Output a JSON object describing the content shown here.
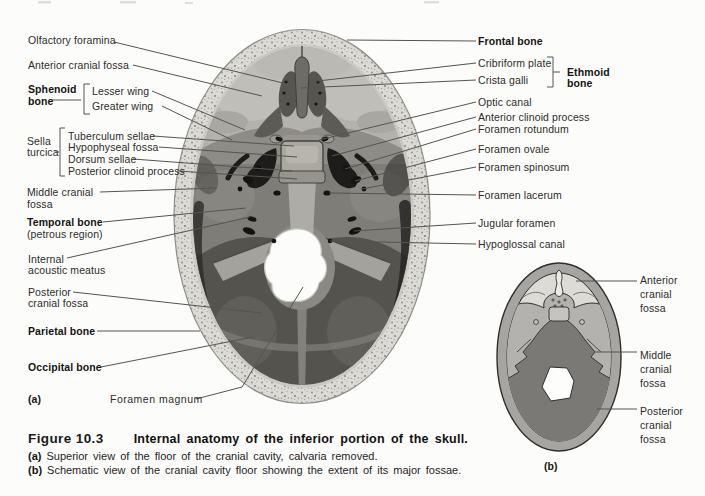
{
  "panel_a": {
    "marker": "(a)",
    "labels": {
      "olfactory_foramina": "Olfactory foramina",
      "anterior_cranial_fossa": "Anterior cranial fossa",
      "sphenoid_bone": [
        "Sphenoid",
        "bone"
      ],
      "lesser_wing": "Lesser wing",
      "greater_wing": "Greater wing",
      "sella_turcica": [
        "Sella",
        "turcica"
      ],
      "tuberculum_sellae": "Tuberculum sellae",
      "hypophyseal_fossa": "Hypophyseal fossa",
      "dorsum_sellae": "Dorsum sellae",
      "posterior_clinoid_process": "Posterior clinoid process",
      "middle_cranial_fossa": [
        "Middle cranial",
        "fossa"
      ],
      "temporal_bone": "Temporal bone",
      "temporal_bone_sub": "(petrous region)",
      "internal_acoustic_meatus": [
        "Internal",
        "acoustic meatus"
      ],
      "posterior_cranial_fossa": [
        "Posterior",
        "cranial fossa"
      ],
      "parietal_bone": "Parietal bone",
      "occipital_bone": "Occipital bone",
      "foramen_magnum": "Foramen magnum",
      "frontal_bone": "Frontal bone",
      "cribriform_plate": "Cribriform plate",
      "crista_galli": "Crista galli",
      "ethmoid_bone": [
        "Ethmoid",
        "bone"
      ],
      "optic_canal": "Optic canal",
      "anterior_clinoid_process": "Anterior clinoid process",
      "foramen_rotundum": "Foramen rotundum",
      "foramen_ovale": "Foramen ovale",
      "foramen_spinosum": "Foramen spinosum",
      "foramen_lacerum": "Foramen lacerum",
      "jugular_foramen": "Jugular foramen",
      "hypoglossal_canal": "Hypoglossal canal"
    }
  },
  "panel_b": {
    "marker": "(b)",
    "labels": {
      "anterior_cranial_fossa": [
        "Anterior",
        "cranial",
        "fossa"
      ],
      "middle_cranial_fossa": [
        "Middle",
        "cranial",
        "fossa"
      ],
      "posterior_cranial_fossa": [
        "Posterior",
        "cranial",
        "fossa"
      ]
    }
  },
  "caption": {
    "figure_label": "Figure 10.3",
    "title": "Internal anatomy of the inferior portion of the skull.",
    "item_a_marker": "(a)",
    "item_a_text": "Superior view of the floor of the cranial cavity, calvaria removed.",
    "item_b_marker": "(b)",
    "item_b_text": "Schematic view of the cranial cavity floor showing the extent of its major fossae."
  },
  "colors": {
    "page_bg": "#fcfcfa",
    "leader_line": "#55544f",
    "text": "#2e2d2b",
    "skull_band": "#dcdad5",
    "anterior_fossa": "#b4b2ac",
    "middle_fossa": "#7f7d78",
    "posterior_fossa": "#55534e",
    "schematic_anterior": "#dddbd5",
    "schematic_middle": "#b4b2ae",
    "schematic_posterior": "#7b7975"
  }
}
